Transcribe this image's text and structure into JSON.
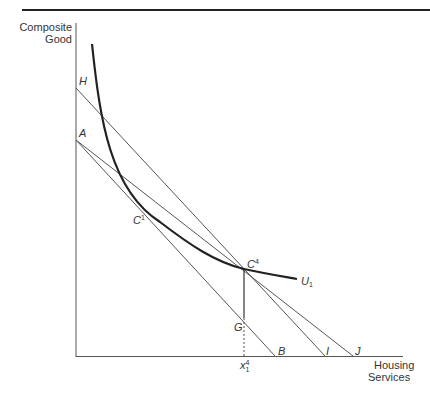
{
  "diagram": {
    "type": "indifference-curve-budget-constraint",
    "axes": {
      "y_label_line1": "Composite",
      "y_label_line2": "Good",
      "x_label_line1": "Housing",
      "x_label_line2": "Services"
    },
    "points": {
      "H": "H",
      "A": "A",
      "B": "B",
      "I": "I",
      "J": "J",
      "G": "G",
      "C1_base": "C",
      "C1_sup": "1",
      "C4_base": "C",
      "C4_sup": "4",
      "x_base": "x",
      "x_sup": "4",
      "x_sub": "1"
    },
    "curve": {
      "label_base": "U",
      "label_sub": "1"
    },
    "lines": [
      {
        "name": "budget-line-AB",
        "from": "A",
        "to": "B"
      },
      {
        "name": "budget-line-HI",
        "from": "H",
        "to": "I"
      },
      {
        "name": "budget-line-AJ",
        "from": "A",
        "to": "J"
      },
      {
        "name": "vertical-C4-G",
        "from": "C4",
        "to": "G"
      },
      {
        "name": "dotted-G-x",
        "from": "G",
        "to": "x"
      }
    ],
    "colors": {
      "line": "#555555",
      "curve": "#222222",
      "text": "#333333"
    }
  }
}
